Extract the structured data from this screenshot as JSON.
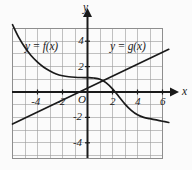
{
  "figure": {
    "background_color": "#fbfbfb",
    "grid_color": "#9a9a9a",
    "axis_color": "#1a1a1a",
    "curve_color": "#1a1a1a",
    "width": 192,
    "height": 170
  },
  "axes": {
    "x_axis_label": "x",
    "y_axis_label": "y",
    "origin_label": "O",
    "x_ticks": [
      {
        "label": "-4",
        "value": -4
      },
      {
        "label": "-2",
        "value": -2
      },
      {
        "label": "2",
        "value": 2
      },
      {
        "label": "4",
        "value": 4
      },
      {
        "label": "6",
        "value": 6
      }
    ],
    "y_ticks": [
      {
        "label": "4",
        "value": 4
      },
      {
        "label": "2",
        "value": 2
      },
      {
        "label": "-2",
        "value": -2
      },
      {
        "label": "-4",
        "value": -4
      }
    ]
  },
  "labels": {
    "f_label": "y = f(x)",
    "g_label": "y = g(x)"
  },
  "chart_data": {
    "type": "line",
    "title": "",
    "xlabel": "x",
    "ylabel": "y",
    "xlim": [
      -6.2,
      6.6
    ],
    "ylim": [
      -5.3,
      5.6
    ],
    "grid": true,
    "grid_step": 1,
    "legend": "inline-annotations",
    "series": [
      {
        "name": "y = f(x)",
        "annotation": "y = f(x)",
        "annotation_x": -3.6,
        "annotation_y": 3.2,
        "description": "Decreasing curve: steep decay from upper-left, flattens near y=1 between x=-2 and x=1, then decreases again to about y=-2.4 at x=6.5",
        "x": [
          -6.0,
          -5.5,
          -5.0,
          -4.5,
          -4.0,
          -3.5,
          -3.0,
          -2.5,
          -2.0,
          -1.5,
          -1.0,
          -0.5,
          0.0,
          0.5,
          1.0,
          1.5,
          2.0,
          2.5,
          3.0,
          3.5,
          4.0,
          4.5,
          5.0,
          5.5,
          6.0,
          6.5
        ],
        "y": [
          5.3,
          4.3,
          3.5,
          2.85,
          2.35,
          1.95,
          1.65,
          1.42,
          1.28,
          1.2,
          1.16,
          1.14,
          1.13,
          1.1,
          1.0,
          0.72,
          0.25,
          -0.35,
          -0.95,
          -1.45,
          -1.8,
          -2.0,
          -2.1,
          -2.2,
          -2.3,
          -2.4
        ]
      },
      {
        "name": "y = g(x)",
        "annotation": "y = g(x)",
        "annotation_x": 2.6,
        "annotation_y": 3.2,
        "description": "Straight line with slope about 0.47 and y-intercept about 0.3",
        "slope": 0.47,
        "intercept": 0.3,
        "x": [
          -6.0,
          6.5
        ],
        "y": [
          -2.52,
          3.36
        ]
      }
    ],
    "intersections": [
      {
        "x": 1.75,
        "y": 1.12
      }
    ]
  }
}
